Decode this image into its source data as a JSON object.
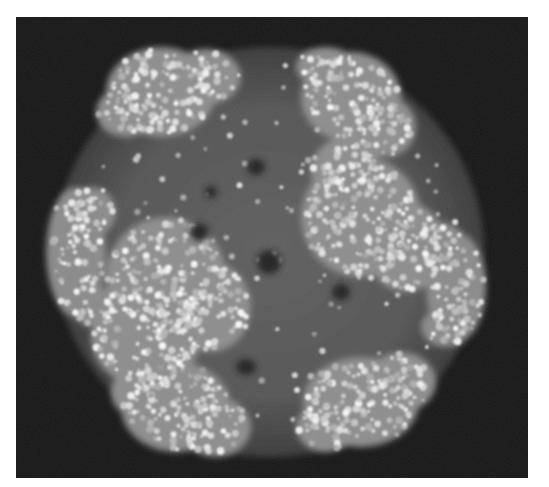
{
  "image": {
    "subject": "molecular-structure-rendering",
    "description": "Grayscale space-filling model of a ring-shaped multi-subunit protein complex on a black background",
    "colors": {
      "background": "#161616",
      "frame": "#ffffff",
      "core": "#5a5a5a",
      "lobe": "#8c8c8c",
      "atom_highlight": "#e6e6e6"
    },
    "lobes": [
      {
        "name": "top-left",
        "brightness": 0.85
      },
      {
        "name": "top-right",
        "brightness": 0.85
      },
      {
        "name": "left",
        "brightness": 0.8
      },
      {
        "name": "center-left",
        "brightness": 0.85
      },
      {
        "name": "right",
        "brightness": 0.85
      },
      {
        "name": "far-right",
        "brightness": 0.8
      },
      {
        "name": "bottom-left",
        "brightness": 0.85
      },
      {
        "name": "bottom-right",
        "brightness": 0.85
      }
    ]
  }
}
